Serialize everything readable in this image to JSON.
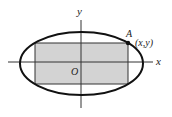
{
  "diagram": {
    "type": "ellipse-inscribed-rectangle",
    "axes": {
      "x_label": "x",
      "y_label": "y",
      "origin_label": "O"
    },
    "point": {
      "name": "A",
      "coords_label": "(x,y)"
    },
    "colors": {
      "stroke": "#111111",
      "rect_fill": "#d3d3d3",
      "axis": "#333333"
    }
  }
}
